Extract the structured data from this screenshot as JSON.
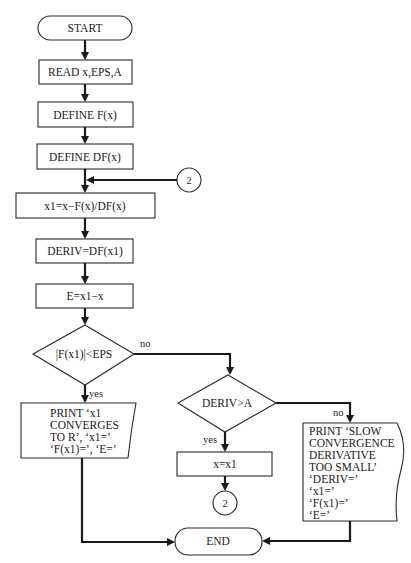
{
  "flowchart": {
    "nodes": {
      "start": {
        "type": "terminal",
        "label": "START"
      },
      "read": {
        "type": "process",
        "label": "READ x,EPS,A"
      },
      "define_f": {
        "type": "process",
        "label": "DEFINE F(x)"
      },
      "define_df": {
        "type": "process",
        "label": "DEFINE DF(x)"
      },
      "connector_in": {
        "type": "connector",
        "label": "2"
      },
      "newton_step": {
        "type": "process",
        "label": "x1=x−F(x)/DF(x)"
      },
      "deriv": {
        "type": "process",
        "label": "DERIV=DF(x1)"
      },
      "error": {
        "type": "process",
        "label": "E=x1−x"
      },
      "decision_eps": {
        "type": "decision",
        "label": "|F(x1)|<EPS"
      },
      "print_converges": {
        "type": "document",
        "lines": [
          "PRINT ‘x1",
          "CONVERGES",
          "TO R’, ‘x1=’",
          "‘F(x1)=’, ‘E=’"
        ]
      },
      "decision_deriv": {
        "type": "decision",
        "label": "DERIV>A"
      },
      "assign": {
        "type": "process",
        "label": "x=x1"
      },
      "connector_out": {
        "type": "connector",
        "label": "2"
      },
      "print_slow": {
        "type": "document",
        "lines": [
          "PRINT ‘SLOW",
          "CONVERGENCE",
          "DERIVATIVE",
          "TOO SMALL’",
          "‘DERIV=’",
          "‘x1=’",
          "‘F(x1)=’",
          "‘E=’"
        ]
      },
      "end": {
        "type": "terminal",
        "label": "END"
      }
    },
    "edge_labels": {
      "eps_no": "no",
      "eps_yes": "yes",
      "deriv_no": "no",
      "deriv_yes": "yes"
    }
  }
}
